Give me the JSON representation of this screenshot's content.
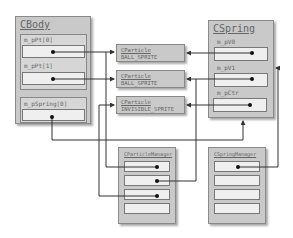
{
  "cbody": {
    "title": "CBody",
    "fields": [
      {
        "label": "m_pPt[0]"
      },
      {
        "label": "m_pPt[1]"
      },
      {
        "label": "m_pSpring[0]"
      }
    ]
  },
  "particles": [
    {
      "class": "CParticle",
      "type": "BALL_SPRITE"
    },
    {
      "class": "CParticle",
      "type": "BALL_SPRITE"
    },
    {
      "class": "CParticle",
      "type": "INVISIBLE_SPRITE"
    }
  ],
  "cspring": {
    "title": "CSpring",
    "fields": [
      {
        "label": "m_pV0"
      },
      {
        "label": "m_pV1"
      },
      {
        "label": "m_pCtr"
      }
    ]
  },
  "managers": [
    {
      "title": "CParticleManager",
      "slots": 4
    },
    {
      "title": "CSpringManager",
      "slots": 4
    }
  ],
  "colors": {
    "box": "#c9c9c9",
    "inner": "#efefef",
    "line": "#333333"
  }
}
